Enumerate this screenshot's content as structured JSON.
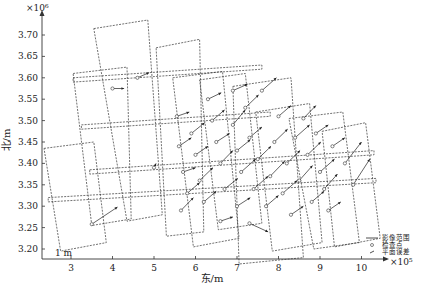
{
  "chart_data": {
    "type": "scatter",
    "title": "",
    "xlabel": "东/m",
    "ylabel": "北/m",
    "x_multiplier": "×10⁵",
    "y_multiplier": "×10⁶",
    "xlim": [
      2.3,
      10.6
    ],
    "ylim": [
      3.18,
      3.74
    ],
    "x_ticks": [
      "3",
      "4",
      "5",
      "6",
      "7",
      "8",
      "9",
      "10"
    ],
    "y_ticks": [
      "3.20",
      "3.25",
      "3.30",
      "3.35",
      "3.40",
      "3.45",
      "3.50",
      "3.55",
      "3.60",
      "3.65",
      "3.70"
    ],
    "scale_label": "1 m",
    "grid": false,
    "legend": {
      "position": "lower-right",
      "entries": [
        {
          "symbol": "line",
          "label": "影像范围"
        },
        {
          "symbol": "circle",
          "label": "检查点"
        },
        {
          "symbol": "arrow",
          "label": "平面误差"
        }
      ]
    },
    "footprints": [
      [
        [
          2.35,
          3.435
        ],
        [
          3.55,
          3.45
        ],
        [
          3.85,
          3.215
        ],
        [
          2.75,
          3.195
        ]
      ],
      [
        [
          3.05,
          3.61
        ],
        [
          4.35,
          3.625
        ],
        [
          4.45,
          3.27
        ],
        [
          3.5,
          3.255
        ]
      ],
      [
        [
          3.55,
          3.715
        ],
        [
          4.85,
          3.735
        ],
        [
          5.2,
          3.28
        ],
        [
          4.35,
          3.265
        ]
      ],
      [
        [
          5.05,
          3.67
        ],
        [
          6.1,
          3.69
        ],
        [
          6.2,
          3.24
        ],
        [
          5.3,
          3.23
        ]
      ],
      [
        [
          5.45,
          3.6
        ],
        [
          6.65,
          3.615
        ],
        [
          7.05,
          3.225
        ],
        [
          5.95,
          3.205
        ]
      ],
      [
        [
          6.1,
          3.595
        ],
        [
          7.2,
          3.61
        ],
        [
          7.6,
          3.26
        ],
        [
          6.55,
          3.245
        ]
      ],
      [
        [
          6.9,
          3.58
        ],
        [
          8.3,
          3.6
        ],
        [
          8.6,
          3.18
        ],
        [
          7.05,
          3.165
        ]
      ],
      [
        [
          7.45,
          3.52
        ],
        [
          8.75,
          3.54
        ],
        [
          9.05,
          3.215
        ],
        [
          7.85,
          3.195
        ]
      ],
      [
        [
          8.25,
          3.505
        ],
        [
          9.55,
          3.52
        ],
        [
          9.95,
          3.215
        ],
        [
          8.85,
          3.2
        ]
      ],
      [
        [
          9.05,
          3.475
        ],
        [
          10.1,
          3.495
        ],
        [
          10.45,
          3.225
        ],
        [
          9.35,
          3.205
        ]
      ],
      [
        [
          2.45,
          3.32
        ],
        [
          10.35,
          3.365
        ],
        [
          10.35,
          3.355
        ],
        [
          2.45,
          3.31
        ]
      ],
      [
        [
          3.45,
          3.385
        ],
        [
          10.3,
          3.43
        ],
        [
          10.3,
          3.42
        ],
        [
          3.45,
          3.375
        ]
      ],
      [
        [
          3.25,
          3.49
        ],
        [
          7.8,
          3.52
        ],
        [
          7.8,
          3.51
        ],
        [
          3.25,
          3.48
        ]
      ],
      [
        [
          3.05,
          3.6
        ],
        [
          7.6,
          3.63
        ],
        [
          7.6,
          3.62
        ],
        [
          3.05,
          3.59
        ]
      ]
    ],
    "check_points": [
      {
        "x": 3.5,
        "y": 3.258,
        "dx": 0.62,
        "dy": 0.04
      },
      {
        "x": 4.0,
        "y": 3.575,
        "dx": 0.28,
        "dy": 0.0
      },
      {
        "x": 4.6,
        "y": 3.6,
        "dx": 0.28,
        "dy": 0.012
      },
      {
        "x": 5.0,
        "y": 3.39,
        "dx": 0.05,
        "dy": 0.01
      },
      {
        "x": 5.55,
        "y": 3.51,
        "dx": 0.3,
        "dy": 0.01
      },
      {
        "x": 5.6,
        "y": 3.44,
        "dx": 0.3,
        "dy": 0.02
      },
      {
        "x": 5.7,
        "y": 3.38,
        "dx": 0.3,
        "dy": 0.01
      },
      {
        "x": 5.8,
        "y": 3.33,
        "dx": 0.3,
        "dy": 0.025
      },
      {
        "x": 5.65,
        "y": 3.29,
        "dx": 0.3,
        "dy": 0.03
      },
      {
        "x": 5.9,
        "y": 3.47,
        "dx": 0.32,
        "dy": 0.025
      },
      {
        "x": 6.0,
        "y": 3.42,
        "dx": 0.3,
        "dy": 0.02
      },
      {
        "x": 6.1,
        "y": 3.36,
        "dx": 0.32,
        "dy": 0.03
      },
      {
        "x": 6.2,
        "y": 3.31,
        "dx": 0.3,
        "dy": 0.025
      },
      {
        "x": 6.3,
        "y": 3.55,
        "dx": 0.32,
        "dy": 0.015
      },
      {
        "x": 6.4,
        "y": 3.5,
        "dx": 0.3,
        "dy": 0.025
      },
      {
        "x": 6.5,
        "y": 3.45,
        "dx": 0.32,
        "dy": 0.02
      },
      {
        "x": 6.6,
        "y": 3.4,
        "dx": 0.3,
        "dy": 0.03
      },
      {
        "x": 6.6,
        "y": 3.265,
        "dx": 0.3,
        "dy": 0.01
      },
      {
        "x": 6.7,
        "y": 3.34,
        "dx": 0.32,
        "dy": 0.025
      },
      {
        "x": 6.9,
        "y": 3.57,
        "dx": 0.35,
        "dy": 0.015
      },
      {
        "x": 6.9,
        "y": 3.49,
        "dx": 0.3,
        "dy": 0.035
      },
      {
        "x": 7.0,
        "y": 3.43,
        "dx": 0.32,
        "dy": 0.025
      },
      {
        "x": 7.0,
        "y": 3.3,
        "dx": 0.32,
        "dy": 0.02
      },
      {
        "x": 7.1,
        "y": 3.38,
        "dx": 0.35,
        "dy": 0.03
      },
      {
        "x": 7.2,
        "y": 3.53,
        "dx": 0.32,
        "dy": 0.03
      },
      {
        "x": 7.3,
        "y": 3.46,
        "dx": 0.3,
        "dy": 0.025
      },
      {
        "x": 7.3,
        "y": 3.26,
        "dx": 0.45,
        "dy": -0.02
      },
      {
        "x": 7.4,
        "y": 3.34,
        "dx": 0.35,
        "dy": 0.03
      },
      {
        "x": 7.5,
        "y": 3.41,
        "dx": 0.32,
        "dy": 0.03
      },
      {
        "x": 7.6,
        "y": 3.57,
        "dx": 0.35,
        "dy": 0.03
      },
      {
        "x": 7.7,
        "y": 3.3,
        "dx": 0.3,
        "dy": 0.025
      },
      {
        "x": 7.8,
        "y": 3.37,
        "dx": 0.35,
        "dy": 0.035
      },
      {
        "x": 7.9,
        "y": 3.45,
        "dx": 0.32,
        "dy": 0.03
      },
      {
        "x": 8.0,
        "y": 3.51,
        "dx": 0.3,
        "dy": 0.025
      },
      {
        "x": 8.1,
        "y": 3.33,
        "dx": 0.35,
        "dy": 0.03
      },
      {
        "x": 8.2,
        "y": 3.4,
        "dx": 0.32,
        "dy": 0.03
      },
      {
        "x": 8.3,
        "y": 3.28,
        "dx": 0.3,
        "dy": 0.02
      },
      {
        "x": 8.4,
        "y": 3.46,
        "dx": 0.35,
        "dy": 0.03
      },
      {
        "x": 8.5,
        "y": 3.36,
        "dx": 0.32,
        "dy": 0.035
      },
      {
        "x": 8.6,
        "y": 3.505,
        "dx": 0.3,
        "dy": 0.03
      },
      {
        "x": 8.7,
        "y": 3.42,
        "dx": 0.32,
        "dy": 0.03
      },
      {
        "x": 8.8,
        "y": 3.31,
        "dx": 0.3,
        "dy": 0.025
      },
      {
        "x": 8.9,
        "y": 3.47,
        "dx": 0.3,
        "dy": 0.02
      },
      {
        "x": 9.0,
        "y": 3.38,
        "dx": 0.35,
        "dy": 0.03
      },
      {
        "x": 9.1,
        "y": 3.34,
        "dx": 0.32,
        "dy": 0.035
      },
      {
        "x": 9.2,
        "y": 3.29,
        "dx": 0.3,
        "dy": 0.02
      },
      {
        "x": 9.3,
        "y": 3.44,
        "dx": 0.3,
        "dy": 0.02
      },
      {
        "x": 9.6,
        "y": 3.4,
        "dx": 0.4,
        "dy": 0.05
      },
      {
        "x": 9.8,
        "y": 3.35,
        "dx": 0.4,
        "dy": 0.06
      }
    ]
  }
}
